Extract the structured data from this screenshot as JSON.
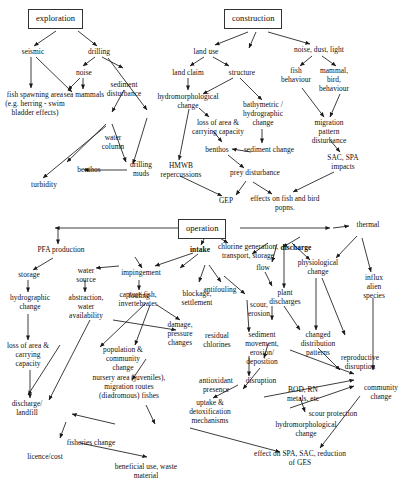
{
  "diagram": {
    "phases": [
      {
        "id": "exploration",
        "label": "exploration"
      },
      {
        "id": "construction",
        "label": "construction"
      },
      {
        "id": "operation",
        "label": "operation"
      }
    ],
    "nodes": {
      "seismic": "seismic",
      "drilling": "drilling",
      "noise": "noise",
      "sediment_disturbance": "sediment disturbance",
      "fish_spawning": "fish spawning area (e.g. herring - swim bladder effects)",
      "sea_mammals": "sea mammals",
      "water_column": "water column",
      "benthos_expl": "benthos",
      "drilling_muds": "drilling muds",
      "turbidity": "turbidity",
      "land_use": "land use",
      "land_claim": "land claim",
      "structure": "structure",
      "hydromorphological_change_con": "hydromorphological change",
      "loss_area_carrying": "loss of area & carrying capacity",
      "bathymetric_change": "bathymetric / hydrographic change",
      "benthos_con": "benthos",
      "sediment_change": "sediment change",
      "hmwb": "HMWB repercussions",
      "prey_disturbance": "prey disturbance",
      "gep": "GEP",
      "effects_fish_bird": "effects on fish and bird popns.",
      "noise_dust_light": "noise, dust, light",
      "fish_behaviour": "fish behaviour",
      "mammal_bird_behaviour": "mammal, bird, behaviour",
      "migration_pattern_disturbance": "migration pattern disturbance",
      "sac_spa_impacts": "SAC, SPA impacts",
      "pfa_production": "PFA production",
      "intake": "intake",
      "chlorine_generation": "chlorine generation, transport, storage",
      "discharge": "discharge",
      "thermal": "thermal",
      "storage": "storage",
      "water_source": "water source",
      "impingement": "impingement",
      "fouling": "fouling",
      "antifouling": "antifouling",
      "flow": "flow",
      "plant_discharges": "plant discharges",
      "physiological_change": "physiological change",
      "hydrographic_change": "hydrographic change",
      "abstraction_water_availability": "abstraction, water availability",
      "capture_fish": "capture fish, invertebrates",
      "blockage_settlement": "blockage, settlement",
      "scour_erosion": "scour, erosion",
      "influx_alien": "influx alien species",
      "loss_area_carrying_op": "loss of area & carrying capacity",
      "damage_pressure": "damage, pressure changes",
      "residual_chlorines": "residual chlorines",
      "sediment_movement": "sediment movement, erosion/ deposition",
      "changed_distribution": "changed distribution patterns",
      "population_community_change": "population & community change",
      "antioxidant_presence": "antioxidant presence",
      "disruption": "disruption",
      "reproductive_disruption": "reproductive disruption",
      "nursery_area": "nursery area (juveniles), migration routes (diadromous) fishes",
      "bod_rn_metals": "BOD, RN metals, etc",
      "community_change": "community change",
      "discharge_landfill": "discharge/ landfill",
      "uptake_detoxification": "uptake & detoxification mechanisms",
      "scour_protection": "scour protection",
      "hydromorphological_change_op": "hydromorphological change",
      "fisheries_change": "fisheries change",
      "licence_cost": "licence/cost",
      "beneficial_use": "beneficial use, waste material",
      "effect_spa_sac": "effect on SPA, SAC, reduction of GES"
    }
  }
}
